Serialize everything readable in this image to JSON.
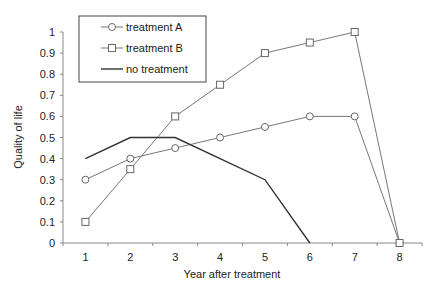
{
  "chart_data": {
    "type": "line",
    "title": "",
    "xlabel": "Year after treatment",
    "ylabel": "Quality of life",
    "categories": [
      "1",
      "2",
      "3",
      "4",
      "5",
      "6",
      "7",
      "8"
    ],
    "x": [
      1,
      2,
      3,
      4,
      5,
      6,
      7,
      8
    ],
    "ylim": [
      0,
      1
    ],
    "yticks": [
      "0",
      "0.1",
      "0.2",
      "0.3",
      "0.4",
      "0.5",
      "0.6",
      "0.7",
      "0.8",
      "0.9",
      "1"
    ],
    "grid": false,
    "legend_position": "upper-left",
    "series": [
      {
        "name": "treatment A",
        "marker": "circle",
        "x": [
          1,
          2,
          3,
          4,
          5,
          6,
          7,
          8
        ],
        "values": [
          0.3,
          0.4,
          0.45,
          0.5,
          0.55,
          0.6,
          0.6,
          0
        ]
      },
      {
        "name": "treatment B",
        "marker": "square",
        "x": [
          1,
          2,
          3,
          4,
          5,
          6,
          7,
          8
        ],
        "values": [
          0.1,
          0.35,
          0.6,
          0.75,
          0.9,
          0.95,
          1.0,
          0
        ]
      },
      {
        "name": "no treatment",
        "marker": "none",
        "x": [
          1,
          2,
          3,
          4,
          5,
          6
        ],
        "values": [
          0.4,
          0.5,
          0.5,
          0.4,
          0.3,
          0
        ]
      }
    ]
  },
  "legend": {
    "items": [
      "treatment A",
      "treatment B",
      "no treatment"
    ]
  }
}
